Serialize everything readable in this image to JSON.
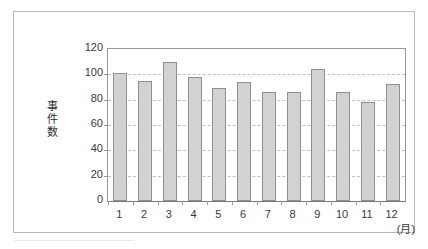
{
  "chart_data": {
    "type": "bar",
    "title": "",
    "subtitle": "",
    "xlabel": "(月)",
    "ylabel": "事件数",
    "categories": [
      "1",
      "2",
      "3",
      "4",
      "5",
      "6",
      "7",
      "8",
      "9",
      "10",
      "11",
      "12"
    ],
    "values": [
      101,
      95,
      110,
      98,
      89,
      94,
      86,
      86,
      104,
      86,
      78,
      92
    ],
    "ylim": [
      0,
      120
    ],
    "yticks": [
      0,
      20,
      40,
      60,
      80,
      100,
      120
    ],
    "ytick_labels": [
      "0",
      "20",
      "40",
      "60",
      "80",
      "100",
      "120"
    ],
    "grid": true,
    "grid_axis": "y",
    "grid_style": "dashed",
    "legend": false,
    "legend_position": "none",
    "series": [
      {
        "name": "事件数",
        "values": [
          101,
          95,
          110,
          98,
          89,
          94,
          86,
          86,
          104,
          86,
          78,
          92
        ]
      }
    ],
    "colors": {
      "bar_fill": "#d2d2d2",
      "bar_edge": "#8f8f8f",
      "gridline": "#c2c2c2",
      "axis": "#9a9a9a",
      "frame": "#b9b9b9",
      "text": "#3a3a3a",
      "background": "#ffffff"
    }
  },
  "figure": {
    "y_axis_title_chars": [
      "事",
      "件",
      "数"
    ],
    "x_unit_label": "(月)"
  }
}
